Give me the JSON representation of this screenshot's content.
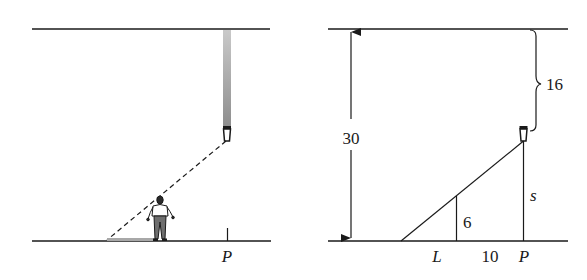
{
  "diagram": {
    "left_panel": {
      "description": "Person walking under a ceiling-suspended lamp casting a shadow",
      "point_label": "P",
      "elements": [
        "ceiling-line",
        "floor-line",
        "lamp-cord",
        "lamp",
        "light-ray-dashed",
        "person",
        "shadow",
        "point-p-tick"
      ]
    },
    "right_panel": {
      "description": "Geometric model of lamp and shadow with similar triangles",
      "height_label": "30",
      "drop_label": "16",
      "person_height_label": "6",
      "shadow_length_label": "L",
      "distance_label": "10",
      "lamp_height_label": "s",
      "point_label": "P"
    },
    "colors": {
      "line": "#1a1a1a",
      "cord": "#9a9a9a",
      "shadow": "#a8a8a8"
    }
  }
}
